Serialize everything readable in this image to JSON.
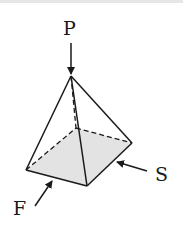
{
  "diagram": {
    "title": "",
    "shape": "square pyramid",
    "labels": {
      "top": "P",
      "front": "F",
      "side": "S"
    },
    "colors": {
      "stroke": "#1a1a1a",
      "base_fill": "#e3e3e3",
      "background": "#ffffff"
    },
    "vertices": {
      "apex": [
        71,
        76
      ],
      "left": [
        26,
        170
      ],
      "front": [
        87,
        186
      ],
      "right": [
        132,
        143
      ],
      "back": [
        76,
        128
      ]
    }
  }
}
